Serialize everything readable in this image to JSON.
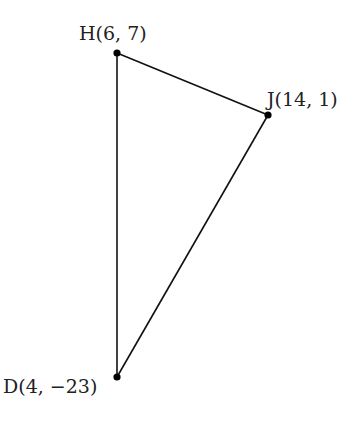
{
  "diagram": {
    "type": "triangle",
    "points": [
      {
        "id": "H",
        "label": "H(6, 7)",
        "x": 6,
        "y": 7
      },
      {
        "id": "J",
        "label": "J(14, 1)",
        "x": 14,
        "y": 1
      },
      {
        "id": "D",
        "label": "D(4, −23)",
        "x": 4,
        "y": -23
      }
    ],
    "edges": [
      [
        "H",
        "J"
      ],
      [
        "J",
        "D"
      ],
      [
        "D",
        "H"
      ]
    ],
    "stroke_color": "#111111",
    "point_color": "#000000"
  }
}
